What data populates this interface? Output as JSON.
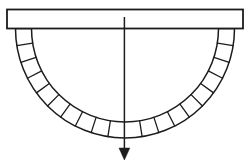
{
  "figure": {
    "background_color": "#ffffff",
    "line_color": "#1c1c1c",
    "canvas": {
      "width": 251,
      "height": 165
    },
    "beam": {
      "x": 7,
      "y": 9.5,
      "width": 236,
      "height": 19,
      "fill": "#ffffff",
      "stroke_width": 1.8
    },
    "arch": {
      "center_x": 125,
      "center_y": 28.5,
      "outer_radius": 109.5,
      "inner_radius": 93.5,
      "fill": "#ffffff",
      "arc_stroke_width": 1.5,
      "divider_stroke_width": 1.3,
      "segment_count": 19,
      "divider_angles_deg": [
        9,
        18,
        27,
        36,
        45,
        54,
        63,
        72,
        81,
        99,
        108,
        117,
        126,
        135,
        144,
        153,
        162,
        171
      ]
    },
    "arrow": {
      "x": 124.4,
      "top_y": 17,
      "line_bottom_y": 149.5,
      "head_base_y": 148,
      "tip_y": 160,
      "head_half_width": 5.4,
      "stroke_width": 1.5
    }
  }
}
